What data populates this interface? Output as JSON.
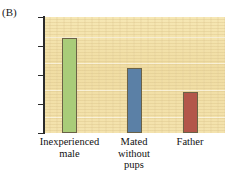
{
  "figure": {
    "panel_label": "(B)"
  },
  "chart_data": {
    "type": "bar",
    "title": "",
    "subtitle": "",
    "xlabel": "",
    "ylabel": "Progesterone (ng/ml)",
    "categories": [
      "Inexperienced\nmale",
      "Mated\nwithout\npups",
      "Father"
    ],
    "values": [
      3.28,
      2.24,
      1.41
    ],
    "series": [
      {
        "name": "Progesterone",
        "values": [
          3.28,
          2.24,
          1.41
        ]
      }
    ],
    "ylim": [
      0,
      4
    ],
    "yticks": [
      0,
      1,
      2,
      3,
      4
    ],
    "ytick_labels": [
      "0",
      "1",
      "2",
      "3",
      "4"
    ],
    "grid": false,
    "legend": false,
    "legend_position": "none",
    "bar_colors": [
      "#a9cc79",
      "#5b80a6",
      "#b3564a"
    ],
    "bar_border_color": "#6b6246",
    "plot_background": "#f2e1a9",
    "axis_color": "#2b2b2b",
    "text_color": "#111111"
  }
}
